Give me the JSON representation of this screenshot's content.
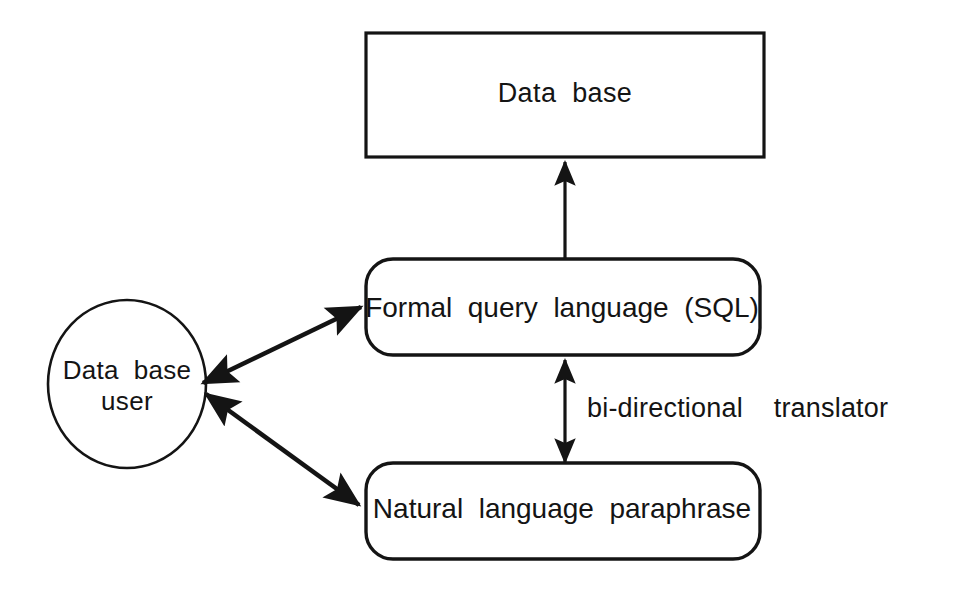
{
  "diagram": {
    "background_color": "#ffffff",
    "stroke_color": "#141414",
    "nodes": {
      "database": {
        "label": "Data  base",
        "shape": "rectangle"
      },
      "formal_query": {
        "label": "Formal  query  language  (SQL)",
        "shape": "rounded-rectangle"
      },
      "natural_language": {
        "label": "Natural  language  paraphrase",
        "shape": "rounded-rectangle"
      },
      "user": {
        "label": "Data  base\nuser",
        "shape": "ellipse"
      }
    },
    "edges": {
      "sql_to_database": {
        "label": "",
        "arrow": "single",
        "from": "formal_query",
        "to": "database"
      },
      "sql_to_nl": {
        "label": "bi-directional    translator",
        "arrow": "double",
        "from": "formal_query",
        "to": "natural_language"
      },
      "user_to_sql": {
        "label": "",
        "arrow": "double",
        "from": "user",
        "to": "formal_query"
      },
      "user_to_nl": {
        "label": "",
        "arrow": "double",
        "from": "user",
        "to": "natural_language"
      }
    }
  }
}
